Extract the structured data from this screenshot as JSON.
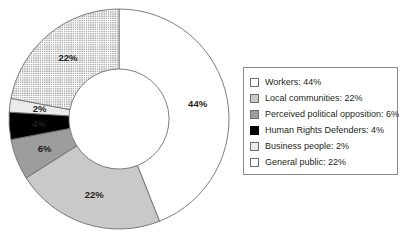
{
  "chart_data": {
    "type": "pie",
    "variant": "donut",
    "title": "",
    "xlabel": "",
    "ylabel": "",
    "categories": [
      "Workers",
      "Local communities",
      "Perceived political opposition",
      "Human Rights Defenders",
      "Business people",
      "General public"
    ],
    "values": [
      44,
      22,
      6,
      4,
      2,
      22
    ],
    "value_labels": [
      "44%",
      "22%",
      "6%",
      "4%",
      "2%",
      "22%"
    ],
    "unit": "%",
    "start_angle_deg": 0,
    "direction": "clockwise",
    "inner_radius_ratio": 0.455,
    "legend_position": "right",
    "grid": false,
    "colors": [
      "#ffffff",
      "#c9c9c9",
      "#9d9d9d",
      "#000000",
      "#ebebeb",
      "#ffffff"
    ],
    "patterns": [
      "solid",
      "solid",
      "solid",
      "solid",
      "solid",
      "dots"
    ],
    "slice_border_color": "#6e6e6e",
    "label_color": "#231f20"
  },
  "legend": {
    "items": [
      {
        "label": "Workers: 44%",
        "swatch": "white-swatch"
      },
      {
        "label": "Local communities: 22%",
        "swatch": "light-medium-gray-swatch"
      },
      {
        "label": "Perceived political opposition: 6%",
        "swatch": "dark-gray-swatch"
      },
      {
        "label": "Human Rights Defenders: 4%",
        "swatch": "black-swatch"
      },
      {
        "label": "Business people: 2%",
        "swatch": "very-light-gray-swatch"
      },
      {
        "label": "General public: 22%",
        "swatch": "dotted-pattern-swatch"
      }
    ]
  },
  "slice_labels": {
    "workers": "44%",
    "local_communities": "22%",
    "perceived_political_opposition": "6%",
    "human_rights_defenders": "4%",
    "business_people": "2%",
    "general_public": "22%"
  }
}
